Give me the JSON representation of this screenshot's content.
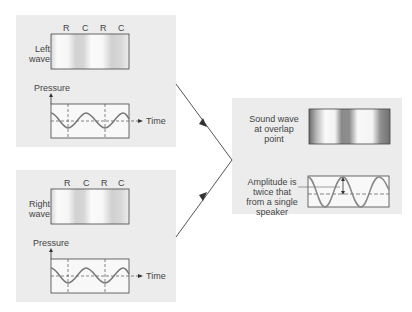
{
  "left_panel": {
    "label_line1": "Left",
    "label_line2": "wave",
    "markers": [
      "R",
      "C",
      "R",
      "C"
    ],
    "graph_ylabel": "Pressure",
    "graph_xlabel": "Time"
  },
  "right_panel": {
    "label_line1": "Right",
    "label_line2": "wave",
    "markers": [
      "R",
      "C",
      "R",
      "C"
    ],
    "graph_ylabel": "Pressure",
    "graph_xlabel": "Time"
  },
  "result_panel": {
    "caption_line1": "Sound wave",
    "caption_line2": "at overlap",
    "caption_line3": "point",
    "note_line1": "Amplitude is",
    "note_line2": "twice that",
    "note_line3": "from a single",
    "note_line4": "speaker"
  }
}
